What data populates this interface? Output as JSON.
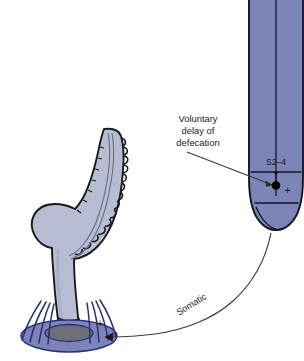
{
  "figure": {
    "background_color": "#ffffff"
  },
  "palette": {
    "spinal_cord_fill": "#7c84b8",
    "spinal_cord_stroke": "#141424",
    "colon_fill": "#b9bdd4",
    "colon_stroke": "#1a1a1a",
    "rectum_fill": "#b9bdd4",
    "pelvic_base_fill": "#7c84b8",
    "pelvic_inner_fill": "#6e6e78",
    "muscle_fiber_stroke": "#2a2f7a",
    "line_stroke": "#3a3a3a",
    "text_color": "#1a1a1a",
    "synapse_dot": "#000000"
  },
  "labels": {
    "callout": {
      "line1": "Voluntary",
      "line2": "delay of",
      "line3": "defecation"
    },
    "spinal_segment": "S2–4",
    "pathway": "Somatic",
    "plus_cord": "+",
    "plus_sphincter": "+"
  },
  "anatomy": {
    "spinal_cord": "spinal-cord",
    "conus": "conus-medullaris",
    "sigmoid_colon": "sigmoid-colon",
    "rectum": "rectum",
    "anal_canal": "anal-canal",
    "pelvic_floor": "pelvic-floor",
    "external_sphincter": "external-anal-sphincter",
    "synapse": "synapse-node"
  }
}
